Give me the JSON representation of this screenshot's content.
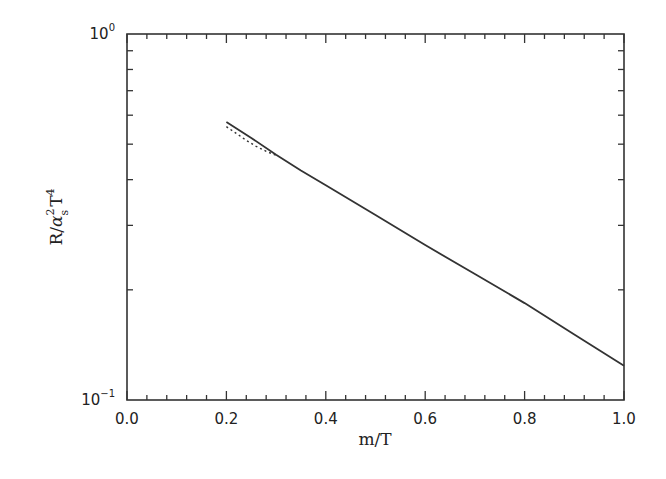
{
  "chart_data": {
    "type": "line",
    "title": "",
    "xlabel": "m/T",
    "ylabel": "R/α_s^2 T^4",
    "ylabel_parts": {
      "base": "R/",
      "alpha": "α",
      "alpha_sup": "2",
      "alpha_sub": "s",
      "T": "T",
      "T_sup": "4"
    },
    "xlim": [
      0.0,
      1.0
    ],
    "ylim": [
      0.1,
      1.0
    ],
    "yscale": "log",
    "grid": false,
    "legend": null,
    "x_ticks": [
      "0.0",
      "0.2",
      "0.4",
      "0.6",
      "0.8",
      "1.0"
    ],
    "x_tick_values": [
      0.0,
      0.2,
      0.4,
      0.6,
      0.8,
      1.0
    ],
    "y_ticks": [
      {
        "base": "10",
        "exp": "0",
        "value": 1.0
      },
      {
        "base": "10",
        "exp": "−1",
        "value": 0.1
      }
    ],
    "series": [
      {
        "name": "solid",
        "style": "solid",
        "x": [
          0.2,
          0.25,
          0.3,
          0.35,
          0.4,
          0.5,
          0.6,
          0.7,
          0.8,
          0.9,
          1.0
        ],
        "values": [
          0.575,
          0.52,
          0.468,
          0.424,
          0.386,
          0.32,
          0.265,
          0.221,
          0.184,
          0.151,
          0.124
        ]
      },
      {
        "name": "dotted",
        "style": "dotted",
        "x": [
          0.2,
          0.22,
          0.24,
          0.26,
          0.28,
          0.3
        ],
        "values": [
          0.558,
          0.535,
          0.512,
          0.493,
          0.478,
          0.466
        ]
      }
    ]
  },
  "colors": {
    "line": "#333333",
    "axis": "#333333",
    "background": "#ffffff"
  }
}
